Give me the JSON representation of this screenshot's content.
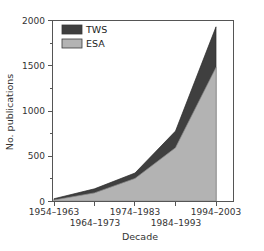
{
  "chart_data": {
    "type": "area",
    "title": "",
    "subtitle": "",
    "xlabel": "Decade",
    "ylabel": "No. publications",
    "categories": [
      "1954–1963",
      "1964–1973",
      "1974–1983",
      "1984–1993",
      "1994–2003"
    ],
    "series": [
      {
        "name": "ESA",
        "values": [
          10,
          90,
          250,
          590,
          1480
        ],
        "color": "#b3b3b3"
      },
      {
        "name": "TWS",
        "values": [
          15,
          45,
          60,
          185,
          450
        ],
        "color": "#3f3f3f"
      }
    ],
    "stacked": true,
    "stacked_totals": [
      25,
      135,
      310,
      775,
      1930
    ],
    "ylim": [
      0,
      2000
    ],
    "ytick_labels": [
      "0",
      "500",
      "1000",
      "1500",
      "2000"
    ],
    "ytick_values": [
      0,
      500,
      1000,
      1500,
      2000
    ],
    "yminor_values": [
      250,
      750,
      1250,
      1750
    ],
    "grid": false,
    "legend_position": "upper left",
    "legend_entries": [
      "TWS",
      "ESA"
    ]
  },
  "axes": {
    "y_title": "No. publications",
    "x_title": "Decade",
    "y_ticks": [
      {
        "label": "2000",
        "value": 2000
      },
      {
        "label": "1500",
        "value": 1500
      },
      {
        "label": "1000",
        "value": 1000
      },
      {
        "label": "500",
        "value": 500
      },
      {
        "label": "0",
        "value": 0
      }
    ],
    "x_ticks": [
      {
        "label": "1954–1963",
        "row": 0
      },
      {
        "label": "1964–1973",
        "row": 1
      },
      {
        "label": "1974–1983",
        "row": 0
      },
      {
        "label": "1984–1993",
        "row": 1
      },
      {
        "label": "1994–2003",
        "row": 0
      }
    ]
  },
  "legend": {
    "items": [
      {
        "label": "TWS",
        "color": "#3f3f3f"
      },
      {
        "label": "ESA",
        "color": "#b3b3b3"
      }
    ]
  },
  "colors": {
    "tws": "#3f3f3f",
    "esa": "#b3b3b3",
    "axis": "#555555",
    "text": "#333333",
    "background": "#ffffff"
  }
}
